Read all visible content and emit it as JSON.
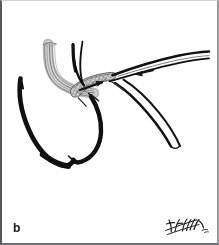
{
  "panel": {
    "label": "b",
    "caption_text": "b",
    "kind": "surgical-line-art-illustration",
    "subject": "endovascular stent-graft deployment at a vessel bifurcation",
    "background_color": "#ffffff",
    "border_color": "#58585a"
  },
  "signature": {
    "name": "artist-signature",
    "alt_text": "handwritten artist signature",
    "ink_color": "#1b1b1b"
  },
  "colors": {
    "ink_black": "#0d0d0d",
    "vessel_black": "#101010",
    "graft_gray_light": "#c9c9c9",
    "graft_gray_mid": "#9b9b9b",
    "graft_gray_dark": "#6d6d6d",
    "mesh_gray": "#8a8a8a",
    "arrow_black": "#141414",
    "paper_white": "#ffffff"
  },
  "illustration": {
    "elements": [
      {
        "name": "delivery-sheath-tube",
        "description": "striped gray catheter sheath descending from upper-left, curving right",
        "color": "#9b9b9b"
      },
      {
        "name": "aneurysm-sac-loop",
        "description": "thick black looping vessel sac occupying lower-left",
        "color": "#101010"
      },
      {
        "name": "stent-graft-segment",
        "description": "cross-hatched mesh band at the junction with internal directional arrow",
        "color": "#8a8a8a"
      },
      {
        "name": "deployment-arrow",
        "description": "black arrow pointing right inside the mesh stent band",
        "color": "#141414"
      },
      {
        "name": "guidewire-arrow",
        "description": "small black arrow pointing left inside the upper-right vessel lumen",
        "color": "#141414"
      },
      {
        "name": "upper-branch-vessel",
        "description": "vessel running to the upper-right margin",
        "color": "#101010"
      },
      {
        "name": "lower-branch-vessel",
        "description": "vessel branching toward the lower-right",
        "color": "#101010"
      },
      {
        "name": "proximal-vessel-neck",
        "description": "black vessel limb rising toward the top of the panel",
        "color": "#101010"
      }
    ]
  }
}
